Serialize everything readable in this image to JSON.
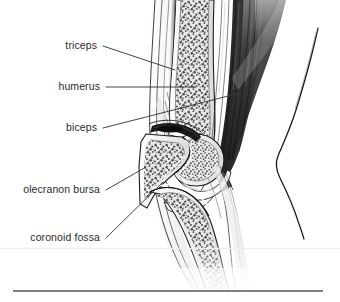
{
  "figure": {
    "view": "medial sagittal section, right elbow, flexed",
    "style": "grayscale medical line illustration with stipple bone texture",
    "background_color": "#ffffff",
    "line_color": "#1a1a1a",
    "label_text_color": "#2b2b2b",
    "leader_line_color": "#3a3a3a"
  },
  "labels": [
    {
      "id": "triceps",
      "text": "triceps",
      "text_x": 97,
      "text_y": 50,
      "leader_from_x": 103,
      "leader_from_y": 46,
      "leader_to_x": 175,
      "leader_to_y": 70
    },
    {
      "id": "humerus",
      "text": "humerus",
      "text_x": 100,
      "text_y": 91,
      "leader_from_x": 106,
      "leader_from_y": 87,
      "leader_to_x": 196,
      "leader_to_y": 87
    },
    {
      "id": "biceps",
      "text": "biceps",
      "text_x": 97,
      "text_y": 132,
      "leader_from_x": 103,
      "leader_from_y": 128,
      "leader_to_x": 240,
      "leader_to_y": 93
    },
    {
      "id": "olecranon-bursa",
      "text": "olecranon bursa",
      "text_x": 100,
      "text_y": 194,
      "leader_from_x": 106,
      "leader_from_y": 190,
      "leader_to_x": 146,
      "leader_to_y": 167
    },
    {
      "id": "coronoid-fossa",
      "text": "coronoid fossa",
      "text_x": 100,
      "text_y": 242,
      "leader_from_x": 106,
      "leader_from_y": 238,
      "leader_to_x": 163,
      "leader_to_y": 182
    }
  ],
  "rules": [
    {
      "id": "faint-rule",
      "x1": 0,
      "x2": 340,
      "y": 248.5,
      "color": "#ededed",
      "thickness": 1.6
    },
    {
      "id": "bottom-rule",
      "x1": 13,
      "x2": 323,
      "y": 291,
      "color": "#808084",
      "thickness": 2.2
    }
  ],
  "anatomy": {
    "structures": [
      "skin and subcutaneous fat contour",
      "triceps brachii muscle",
      "humerus shaft with trabecular bone",
      "biceps brachii and brachialis muscle",
      "trochlea of humerus",
      "olecranon of ulna",
      "coronoid process of ulna",
      "joint capsule and articular cartilage",
      "olecranon bursa",
      "coronoid fossa",
      "posterior arm skin contour"
    ]
  }
}
